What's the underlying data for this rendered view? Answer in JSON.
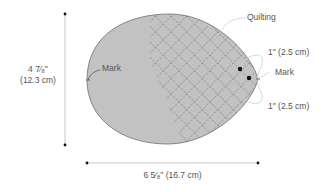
{
  "diagram": {
    "shape": "egg-shaped pattern piece",
    "colors": {
      "fill": "#c2c2c2",
      "outline": "#7a7a7a",
      "quilting": "#6e6e6e",
      "dimension_line": "#bbbbbb",
      "leader_line": "#bdbdbd",
      "dot": "#111111",
      "text": "#555555"
    },
    "labels": {
      "height_line1": "4 ·⁄₈\"",
      "height_fraction_whole": "4",
      "height_fraction": "7⁄₈\"",
      "height_cm": "(12.3 cm)",
      "width": "6 ⁵⁄₈\" (16.7 cm)",
      "width_whole": "6",
      "width_fraction": "5⁄₈\"",
      "width_cm": "(16.7 cm)",
      "mark_left": "Mark",
      "mark_right": "Mark",
      "quilting": "Quilting",
      "offset_top": "1\" (2.5 cm)",
      "offset_bottom": "1\" (2.5 cm)"
    }
  }
}
